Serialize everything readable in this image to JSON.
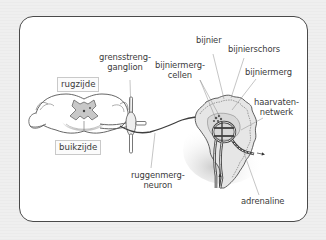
{
  "diagram": {
    "topic": "sympathetic innervation of the adrenal gland",
    "labels": {
      "rugzijde": "rugzijde",
      "buikzijde": "buikzijde",
      "grensstrengganglion_line1": "grensstreng-",
      "grensstrengganglion_line2": "ganglion",
      "bijnier": "bijnier",
      "bijnierschors": "bijnierschors",
      "bijniermergcellen_line1": "bijniermerg-",
      "bijniermergcellen_line2": "cellen",
      "bijniermerg": "bijniermerg",
      "haarvatennetwerk_line1": "haarvaten-",
      "haarvatennetwerk_line2": "netwerk",
      "ruggenmergneuron_line1": "ruggenmerg-",
      "ruggenmergneuron_line2": "neuron",
      "adrenaline": "adrenaline"
    },
    "colors": {
      "background": "#ececec",
      "card": "#ffffff",
      "card_border": "#4a4a4a",
      "tissue_fill": "#e4e4e4",
      "grey_matter": "#c8c8c8",
      "line": "#555555",
      "leader_line": "#8a8a8a",
      "text": "#3a3a3a"
    }
  }
}
